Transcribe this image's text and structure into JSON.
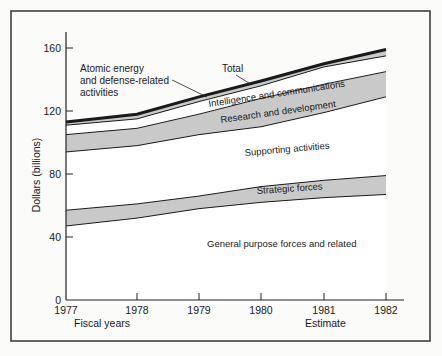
{
  "chart_data": {
    "type": "area",
    "stacked": true,
    "title": "",
    "xlabel": "Fiscal years",
    "xlabel_secondary": "Estimate",
    "ylabel": "Dollars (billions)",
    "ylim": [
      0,
      170
    ],
    "yticks": [
      0,
      40,
      80,
      120,
      160
    ],
    "x": [
      1977,
      1978,
      1979,
      1980,
      1981,
      1982
    ],
    "xtick_labels": [
      "1977",
      "1978",
      "1979",
      "1980",
      "1981",
      "1982"
    ],
    "grid": false,
    "legend": "inline labels",
    "series": [
      {
        "name": "General purpose forces and related",
        "values": [
          47,
          52,
          58,
          62,
          65,
          67
        ],
        "fill": "#ffffff"
      },
      {
        "name": "Strategic forces",
        "values": [
          10,
          9,
          8,
          10,
          11,
          12
        ],
        "fill": "#c9c9c9"
      },
      {
        "name": "Supporting activities",
        "values": [
          37,
          37,
          39,
          38,
          43,
          50
        ],
        "fill": "#ffffff"
      },
      {
        "name": "Research and development",
        "values": [
          11,
          11,
          13,
          18,
          18,
          16
        ],
        "fill": "#c9c9c9"
      },
      {
        "name": "Intelligence and communications",
        "values": [
          6,
          6,
          8,
          8,
          11,
          10
        ],
        "fill": "#ffffff"
      },
      {
        "name": "Atomic energy and defense-related activities",
        "values": [
          2,
          3,
          3,
          3,
          2,
          4
        ],
        "fill": "#c9c9c9"
      }
    ],
    "cumulative_top": {
      "general_purpose": [
        47,
        52,
        58,
        62,
        65,
        67
      ],
      "strategic": [
        57,
        61,
        66,
        72,
        76,
        79
      ],
      "supporting": [
        94,
        98,
        105,
        110,
        119,
        129
      ],
      "research": [
        105,
        109,
        118,
        128,
        137,
        145
      ],
      "intelligence": [
        111,
        115,
        126,
        136,
        148,
        155
      ],
      "total": [
        113,
        118,
        129,
        139,
        150,
        159
      ]
    },
    "annotations": [
      {
        "text": "Total",
        "points_to": "total line"
      },
      {
        "text": "Atomic energy and defense-related activities",
        "points_to": "thin band below total"
      },
      {
        "text": "Intelligence and communications"
      },
      {
        "text": "Research and development"
      },
      {
        "text": "Supporting activities"
      },
      {
        "text": "Strategic forces"
      },
      {
        "text": "General purpose forces and related"
      }
    ]
  },
  "labels": {
    "total": "Total",
    "atomic_1": "Atomic energy",
    "atomic_2": "and defense-related",
    "atomic_3": "activities",
    "intelligence": "Intelligence and communications",
    "research": "Research and development",
    "supporting": "Supporting activities",
    "strategic": "Strategic forces",
    "general": "General purpose forces and related",
    "ylabel": "Dollars (billions)",
    "xlabel": "Fiscal years",
    "estimate": "Estimate"
  }
}
